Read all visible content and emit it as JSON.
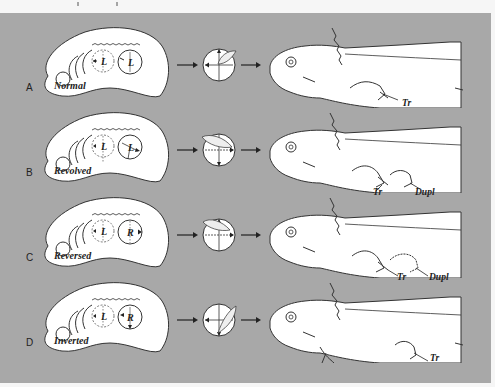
{
  "figure": {
    "background_color": "#a8a8a8",
    "shape_fill": "#ffffff",
    "line_color": "#333333",
    "rows": [
      {
        "letter": "A",
        "caption": "Normal",
        "embryo_discs": [
          "L",
          "L"
        ],
        "larva_labels": [
          "Tr"
        ]
      },
      {
        "letter": "B",
        "caption": "Revolved",
        "embryo_discs": [
          "L",
          "L"
        ],
        "larva_labels": [
          "Tr",
          "Dupl"
        ]
      },
      {
        "letter": "C",
        "caption": "Reversed",
        "embryo_discs": [
          "L",
          "R"
        ],
        "larva_labels": [
          "Tr",
          "Dupl"
        ]
      },
      {
        "letter": "D",
        "caption": "Inverted",
        "embryo_discs": [
          "L",
          "R"
        ],
        "larva_labels": [
          "Tr"
        ]
      }
    ]
  }
}
